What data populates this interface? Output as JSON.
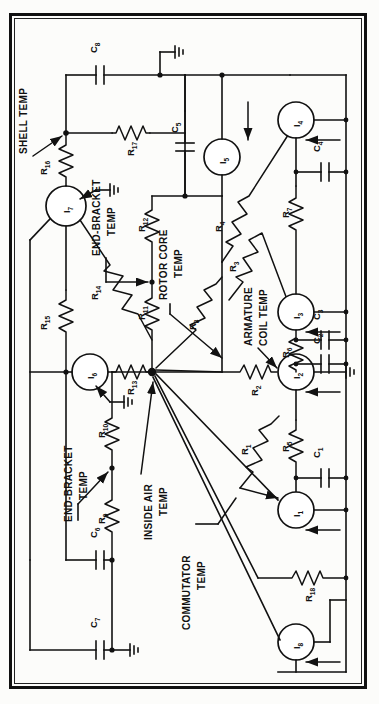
{
  "figure": {
    "type": "thermal-equivalent-circuit-diagram",
    "orientation": "rotated-90-ccw",
    "title": ""
  },
  "annotations": [
    {
      "id": "shell",
      "text": "SHELL TEMP",
      "points_to": "node-shell"
    },
    {
      "id": "endbracket_top",
      "text": "END-BRACKET",
      "text2": "TEMP",
      "points_to": "node-R12-R11"
    },
    {
      "id": "rotorcore",
      "text": "ROTOR CORE",
      "text2": "TEMP",
      "points_to": "node-R3-R4"
    },
    {
      "id": "armature",
      "text": "ARMATURE",
      "text2": "COIL TEMP",
      "points_to": "node-R2-I2"
    },
    {
      "id": "endbracket_bottom",
      "text": "END-BRACKET",
      "text2": "TEMP",
      "points_to": "node-R9-R10"
    },
    {
      "id": "insideair",
      "text": "INSIDE AIR",
      "text2": "TEMP",
      "points_to": "node-center"
    },
    {
      "id": "commutator",
      "text": "COMMUTATOR",
      "text2": "TEMP",
      "points_to": "node-R1-I1"
    }
  ],
  "resistors": [
    {
      "name": "R",
      "sub": "1"
    },
    {
      "name": "R",
      "sub": "2"
    },
    {
      "name": "R",
      "sub": "3"
    },
    {
      "name": "R",
      "sub": "4"
    },
    {
      "name": "R",
      "sub": "5"
    },
    {
      "name": "R",
      "sub": "6"
    },
    {
      "name": "R",
      "sub": "7"
    },
    {
      "name": "R",
      "sub": "8"
    },
    {
      "name": "R",
      "sub": "9"
    },
    {
      "name": "R",
      "sub": "10"
    },
    {
      "name": "R",
      "sub": "11"
    },
    {
      "name": "R",
      "sub": "12"
    },
    {
      "name": "R",
      "sub": "13"
    },
    {
      "name": "R",
      "sub": "14"
    },
    {
      "name": "R",
      "sub": "15"
    },
    {
      "name": "R",
      "sub": "16"
    },
    {
      "name": "R",
      "sub": "17"
    },
    {
      "name": "R",
      "sub": "18"
    }
  ],
  "capacitors": [
    {
      "name": "C",
      "sub": "1"
    },
    {
      "name": "C",
      "sub": "2"
    },
    {
      "name": "C",
      "sub": "3"
    },
    {
      "name": "C",
      "sub": "4"
    },
    {
      "name": "C",
      "sub": "5"
    },
    {
      "name": "C",
      "sub": "6"
    },
    {
      "name": "C",
      "sub": "7"
    },
    {
      "name": "C",
      "sub": "8"
    }
  ],
  "current_sources": [
    {
      "name": "I",
      "sub": "1"
    },
    {
      "name": "I",
      "sub": "2"
    },
    {
      "name": "I",
      "sub": "3"
    },
    {
      "name": "I",
      "sub": "4"
    },
    {
      "name": "I",
      "sub": "5"
    },
    {
      "name": "I",
      "sub": "6"
    },
    {
      "name": "I",
      "sub": "7"
    },
    {
      "name": "I",
      "sub": "8"
    }
  ],
  "labels": {
    "R1": "R",
    "R1s": "1",
    "R2": "R",
    "R2s": "2",
    "R3": "R",
    "R3s": "3",
    "R4": "R",
    "R4s": "4",
    "R5": "R",
    "R5s": "5",
    "R6": "R",
    "R6s": "6",
    "R7": "R",
    "R7s": "7",
    "R8": "R",
    "R8s": "8",
    "R9": "R",
    "R9s": "9",
    "R10": "R",
    "R10s": "10",
    "R11": "R",
    "R11s": "11",
    "R12": "R",
    "R12s": "12",
    "R13": "R",
    "R13s": "13",
    "R14": "R",
    "R14s": "14",
    "R15": "R",
    "R15s": "15",
    "R16": "R",
    "R16s": "16",
    "R17": "R",
    "R17s": "17",
    "R18": "R",
    "R18s": "18",
    "C1": "C",
    "C1s": "1",
    "C2": "C",
    "C2s": "2",
    "C3": "C",
    "C3s": "3",
    "C4": "C",
    "C4s": "4",
    "C5": "C",
    "C5s": "5",
    "C6": "C",
    "C6s": "6",
    "C7": "C",
    "C7s": "7",
    "C8": "C",
    "C8s": "8",
    "I1": "I",
    "I1s": "1",
    "I2": "I",
    "I2s": "2",
    "I3": "I",
    "I3s": "3",
    "I4": "I",
    "I4s": "4",
    "I5": "I",
    "I5s": "5",
    "I6": "I",
    "I6s": "6",
    "I7": "I",
    "I7s": "7",
    "I8": "I",
    "I8s": "8",
    "shell_temp": "SHELL TEMP",
    "end_bracket_1": "END-BRACKET",
    "temp_1": "TEMP",
    "rotor_core": "ROTOR CORE",
    "temp_2": "TEMP",
    "armature": "ARMATURE",
    "coil_temp": "COIL TEMP",
    "end_bracket_2": "END-BRACKET",
    "temp_3": "TEMP",
    "inside_air": "INSIDE AIR",
    "temp_4": "TEMP",
    "commutator": "COMMUTATOR",
    "temp_5": "TEMP"
  },
  "colors": {
    "ink": "#111111",
    "paper": "#fcfcfa"
  }
}
